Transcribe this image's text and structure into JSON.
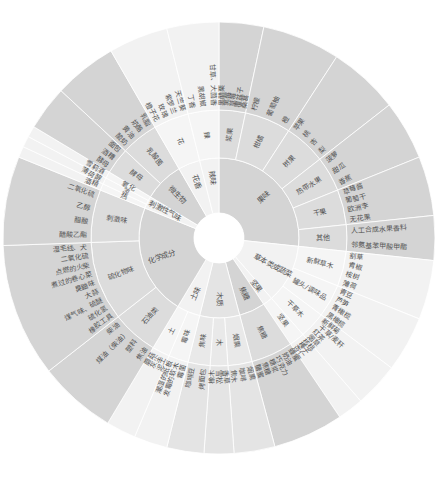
{
  "chart_data": {
    "type": "sunburst",
    "center": {
      "cx": 219,
      "cy": 238
    },
    "radii": [
      25,
      80,
      128,
      216
    ],
    "colors": {
      "dark": "#d4d4d4",
      "mid": "#e4e4e4",
      "light": "#f2f2f2",
      "stroke": "#ffffff",
      "text": "#555555"
    },
    "categories": [
      {
        "name": "果味",
        "start": 0,
        "end": 96,
        "tone": "dark",
        "children": [
          {
            "name": "浆果",
            "start": 0,
            "end": 12,
            "leaves": [
              "黑醋栗",
              "黑莓",
              "草莓",
              "覆盆子",
              "桑葚"
            ]
          },
          {
            "name": "柑橘",
            "start": 12,
            "end": 33,
            "leaves": [
              "柠檬",
              "葡萄柚",
              "橙"
            ]
          },
          {
            "name": "树果",
            "start": 33,
            "end": 52,
            "leaves": [
              "苹果",
              "桃",
              "杏",
              "梨"
            ]
          },
          {
            "name": "热带水果",
            "start": 52,
            "end": 68,
            "leaves": [
              "菠萝",
              "甜瓜",
              "香蕉"
            ]
          },
          {
            "name": "干果",
            "start": 68,
            "end": 84,
            "leaves": [
              "草莓酱",
              "葡萄干",
              "欧洲李",
              "无花果"
            ]
          },
          {
            "name": "其他",
            "start": 84,
            "end": 96,
            "leaves": [
              "人工合成水果香料",
              "邻氨基苯甲酸甲酯"
            ]
          }
        ]
      },
      {
        "name": "草本类或蔬菜",
        "start": 96,
        "end": 139,
        "tone": "light",
        "children": [
          {
            "name": "新鲜草木",
            "start": 96,
            "end": 112,
            "leaves": [
              "割草",
              "青椒",
              "桉树",
              "薄荷"
            ]
          },
          {
            "name": "罐头/调味品",
            "start": 112,
            "end": 127,
            "leaves": [
              "青豆",
              "芦笋",
              "青橄榄",
              "黑橄榄"
            ]
          },
          {
            "name": "干草木",
            "start": 127,
            "end": 139,
            "leaves": [
              "新鲜菊",
              "干草/麦秆",
              "红茶",
              "烟草"
            ]
          }
        ]
      },
      {
        "name": "坚果",
        "start": 139,
        "end": 146,
        "tone": "light",
        "children": [
          {
            "name": "坚果",
            "start": 139,
            "end": 146,
            "leaves": [
              "核桃",
              "榛子",
              "杏仁"
            ]
          }
        ]
      },
      {
        "name": "焦糖",
        "start": 146,
        "end": 165,
        "tone": "dark",
        "children": [
          {
            "name": "焦糖",
            "start": 146,
            "end": 165,
            "leaves": [
              "蜂蜜",
              "奶油",
              "巧克力",
              "糖浆",
              "焦糖",
              "糖蜜"
            ]
          }
        ]
      },
      {
        "name": "木质",
        "start": 165,
        "end": 194,
        "tone": "mid",
        "children": [
          {
            "name": "烟熏",
            "start": 165,
            "end": 176,
            "leaves": [
              "烟熏",
              "咖啡",
              "焦木"
            ]
          },
          {
            "name": "木",
            "start": 176,
            "end": 184,
            "leaves": [
              "香草",
              "雪松",
              "橡木"
            ]
          },
          {
            "name": "焦味",
            "start": 184,
            "end": 194,
            "leaves": [
              "烤面包",
              "咖啡豆"
            ]
          }
        ]
      },
      {
        "name": "土味",
        "start": 194,
        "end": 211,
        "tone": "light",
        "children": [
          {
            "name": "霉味",
            "start": 194,
            "end": 203,
            "leaves": [
              "霉菌",
              "发霉的软木",
              "潮湿的纸板"
            ]
          },
          {
            "name": "土",
            "start": 203,
            "end": 211,
            "leaves": [
              "泥土",
              "灰尘",
              "蘑菇"
            ]
          }
        ]
      },
      {
        "name": "化学成分",
        "start": 211,
        "end": 292,
        "tone": "dark",
        "children": [
          {
            "name": "石油类",
            "start": 211,
            "end": 232,
            "leaves": [
              "焦油",
              "塑料",
              "煤油（柴油）",
              "柴油"
            ]
          },
          {
            "name": "硫化物味",
            "start": 232,
            "end": 268,
            "leaves": [
              "橡胶工具",
              "硫化氢",
              "煤气味、硫醚",
              "大蒜",
              "臭鼬味",
              "煮过的卷心菜",
              "点燃的火柴",
              "二氧化硫",
              "湿毛线、犬"
            ]
          },
          {
            "name": "刺激味",
            "start": 268,
            "end": 292,
            "leaves": [
              "醋酸乙酯",
              "醋酸",
              "乙醇",
              "二氧化硫"
            ]
          }
        ]
      },
      {
        "name": "刺激性气味",
        "start": 292,
        "end": 301,
        "tone": "light",
        "children": [
          {
            "name": "热",
            "start": 292,
            "end": 295,
            "leaves": [
              "酒精"
            ]
          },
          {
            "name": "凉",
            "start": 295,
            "end": 298,
            "leaves": [
              "薄荷醇"
            ]
          },
          {
            "name": "氧化",
            "start": 298,
            "end": 301,
            "leaves": [
              "雪莉酒"
            ]
          }
        ]
      },
      {
        "name": "微生物",
        "start": 301,
        "end": 330,
        "tone": "dark",
        "children": [
          {
            "name": "酵母",
            "start": 301,
            "end": 313,
            "leaves": [
              "酵母",
              "酒糟",
              "面包"
            ]
          },
          {
            "name": "乳酸菌",
            "start": 313,
            "end": 330,
            "leaves": [
              "酸奶",
              "黄油",
              "奶酪",
              "乳脂"
            ]
          }
        ]
      },
      {
        "name": "花香",
        "start": 330,
        "end": 346,
        "tone": "light",
        "children": [
          {
            "name": "花",
            "start": 330,
            "end": 346,
            "leaves": [
              "橙子花",
              "玫瑰",
              "紫罗兰",
              "天竺葵"
            ]
          }
        ]
      },
      {
        "name": "辣味",
        "start": 346,
        "end": 360,
        "tone": "light",
        "children": [
          {
            "name": "辣",
            "start": 346,
            "end": 360,
            "leaves": [
              "丁香",
              "黑胡椒",
              "甘草、大茴香"
            ]
          }
        ]
      }
    ]
  }
}
